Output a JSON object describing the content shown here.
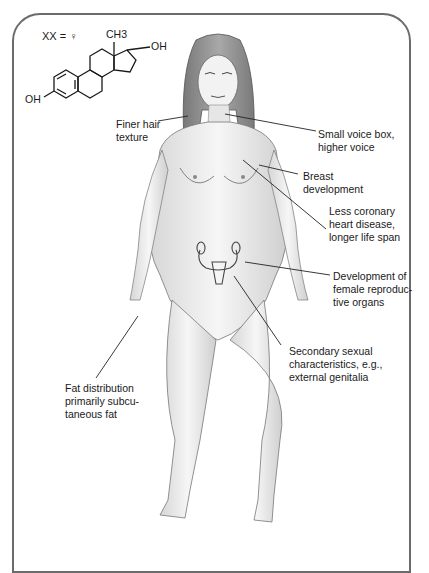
{
  "header": {
    "genotype": "XX = ♀"
  },
  "molecule": {
    "name_icon": "estradiol-structure",
    "methyl_label": "CH3",
    "hydroxyl_top": "OH",
    "hydroxyl_left": "OH"
  },
  "labels": {
    "hair": "Finer hair\ntexture",
    "voice": "Small voice box,\nhigher voice",
    "breast": "Breast\ndevelopment",
    "heart": "Less coronary\nheart disease,\nlonger life span",
    "reproductive": "Development of\nfemale reproduc-\ntive organs",
    "secondary": "Secondary sexual\ncharacteristics, e.g.,\nexternal genitalia",
    "fat": "Fat distribution\nprimarily subcu-\ntaneous fat"
  },
  "colors": {
    "frame": "#6b6b6b",
    "ink": "#1a1a1a",
    "skin_shade": "#bdbdbd"
  }
}
